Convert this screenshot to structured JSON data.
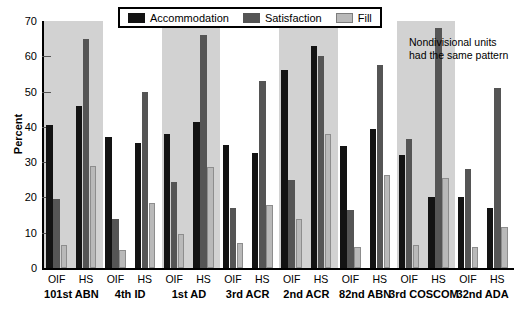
{
  "chart_data": {
    "type": "bar",
    "title": "",
    "xlabel": "",
    "ylabel": "Percent",
    "ylim": [
      0,
      70
    ],
    "yticks": [
      0,
      10,
      20,
      30,
      40,
      50,
      60,
      70
    ],
    "grid": false,
    "legend_position": "top-center",
    "legend": [
      "Accommodation",
      "Satisfaction",
      "Fill"
    ],
    "annotation": "Nondivisional units had the same pattern",
    "group_labels": [
      "101st ABN",
      "4th ID",
      "1st AD",
      "3rd ACR",
      "2nd ACR",
      "82nd ABN",
      "3rd COSCOM",
      "32nd ADA"
    ],
    "subgroup_labels": [
      "OIF",
      "HS"
    ],
    "categories": [
      "101st ABN OIF",
      "101st ABN HS",
      "4th ID OIF",
      "4th ID HS",
      "1st AD OIF",
      "1st AD HS",
      "3rd ACR OIF",
      "3rd ACR HS",
      "2nd ACR OIF",
      "2nd ACR HS",
      "82nd ABN OIF",
      "82nd ABN HS",
      "3rd COSCOM OIF",
      "3rd COSCOM HS",
      "32nd ADA OIF",
      "32nd ADA HS"
    ],
    "series": [
      {
        "name": "Accommodation",
        "color": "#131313",
        "values": [
          40.5,
          46,
          37,
          35.5,
          38,
          41.5,
          35,
          32.5,
          56,
          63,
          34.5,
          39.5,
          32,
          20,
          20,
          17
        ]
      },
      {
        "name": "Satisfaction",
        "color": "#555555",
        "values": [
          19.5,
          65,
          14,
          50,
          24.5,
          66,
          17,
          53,
          25,
          60,
          16.5,
          57.5,
          36.5,
          68,
          28,
          51
        ]
      },
      {
        "name": "Fill",
        "color": "#b9b9b9",
        "values": [
          6.5,
          29,
          5,
          18.5,
          9.5,
          28.5,
          7,
          18,
          14,
          38,
          6,
          26.5,
          6.5,
          25.5,
          6,
          11.5
        ]
      }
    ],
    "shaded_groups": [
      0,
      2,
      4,
      6
    ]
  }
}
